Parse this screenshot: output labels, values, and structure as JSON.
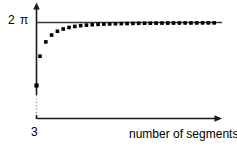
{
  "figure": {
    "background_color": "#ffffff",
    "ink_color": "#1a1a1a",
    "point_color": "#000000"
  },
  "labels": {
    "y_axis_tick": "2 π",
    "x_axis_origin_tick": "3",
    "x_axis_title": "number of segments"
  },
  "chart_data": {
    "type": "scatter",
    "title": "",
    "subtitle": "",
    "xlabel": "number of segments",
    "ylabel": "",
    "x_tick_labels": [
      "3"
    ],
    "y_tick_labels": [
      "2 π"
    ],
    "grid": false,
    "legend": null,
    "annotations": [
      {
        "name": "asymptote-line",
        "text": "",
        "kind": "horizontal-reference-line",
        "y_value": 6.283185,
        "y_label": "2 π"
      },
      {
        "name": "axis-break",
        "text": "",
        "kind": "dotted-y-axis-break",
        "note": "y-axis drawn with a dotted segment indicating a scale break below the data"
      }
    ],
    "axis_break": true,
    "xlim": [
      3,
      34
    ],
    "ylim": [
      0,
      6.6
    ],
    "ylim_display_note": "y-axis truncated below the first data value; dotted segment marks the break",
    "series": [
      {
        "name": "polygon perimeter",
        "marker": "square-dot",
        "x": [
          3,
          4,
          5,
          6,
          7,
          8,
          9,
          10,
          11,
          12,
          13,
          14,
          15,
          16,
          17,
          18,
          19,
          20,
          21,
          22,
          23,
          24,
          25,
          26,
          27,
          28,
          29,
          30,
          31,
          32,
          33
        ],
        "y": [
          5.196,
          5.657,
          5.878,
          6.0,
          6.074,
          6.123,
          6.157,
          6.181,
          6.199,
          6.212,
          6.223,
          6.231,
          6.238,
          6.243,
          6.247,
          6.251,
          6.254,
          6.257,
          6.259,
          6.261,
          6.262,
          6.264,
          6.265,
          6.266,
          6.267,
          6.268,
          6.268,
          6.269,
          6.27,
          6.27,
          6.271
        ]
      },
      {
        "name": "origin marker",
        "marker": "square-dot",
        "x": [
          3
        ],
        "y": [
          0
        ],
        "note": "single dot sitting on the y-axis above the dotted break"
      }
    ]
  }
}
